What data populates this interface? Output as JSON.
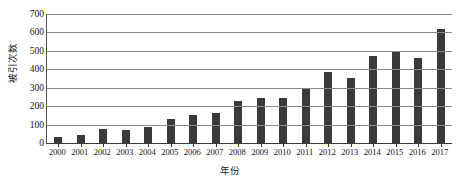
{
  "chart_data": {
    "type": "bar",
    "title": "",
    "xlabel": "年份",
    "ylabel": "被引次数",
    "categories": [
      "2000",
      "2001",
      "2002",
      "2003",
      "2004",
      "2005",
      "2006",
      "2007",
      "2008",
      "2009",
      "2010",
      "2011",
      "2012",
      "2013",
      "2014",
      "2015",
      "2016",
      "2017"
    ],
    "values": [
      35,
      45,
      75,
      72,
      88,
      132,
      152,
      162,
      228,
      245,
      245,
      295,
      385,
      355,
      470,
      495,
      460,
      618
    ],
    "series": [
      {
        "name": "被引次数",
        "values": [
          35,
          45,
          75,
          72,
          88,
          132,
          152,
          162,
          228,
          245,
          245,
          295,
          385,
          355,
          470,
          495,
          460,
          618
        ]
      }
    ],
    "ylim": [
      0,
      700
    ],
    "yticks": [
      0,
      100,
      200,
      300,
      400,
      500,
      600,
      700
    ],
    "ytick_labels": [
      "0",
      "100",
      "200",
      "300",
      "400",
      "500",
      "600",
      "700"
    ],
    "grid": true,
    "grid_axis": "y",
    "legend": false,
    "legend_position": "none",
    "bar_color": "#3a3a3a",
    "gridline_color": "#8a8a8a",
    "axis_color": "#3a3a3a",
    "background_color": "#ffffff"
  }
}
